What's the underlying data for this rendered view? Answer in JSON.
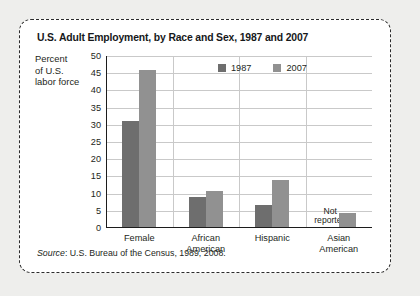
{
  "figure": {
    "title": "U.S. Adult Employment, by Race and Sex, 1987 and 2007",
    "axis_title_lines": [
      "Percent",
      "of U.S.",
      "labor force"
    ],
    "source_label": "Source",
    "source_text": ": U.S. Bureau of the Census, 1989, 2008.",
    "annotation": {
      "line1": "Not",
      "line2": "reported"
    }
  },
  "colors": {
    "series_1987": "#6e6e6e",
    "series_2007": "#919191",
    "grid": "#c9c9c9",
    "axis": "#1c1c1c",
    "panel_background": "#ffffff",
    "page_background": "#eeeeec",
    "text": "#1d1f21"
  },
  "chart_data": {
    "type": "bar",
    "title": "U.S. Adult Employment, by Race and Sex, 1987 and 2007",
    "xlabel": "",
    "ylabel": "Percent of U.S. labor force",
    "ylim": [
      0,
      50
    ],
    "ytick_step": 5,
    "yticks": [
      "50",
      "45",
      "40",
      "35",
      "30",
      "25",
      "20",
      "15",
      "10",
      "5",
      "0"
    ],
    "grid": true,
    "legend_position": "inside top-center",
    "categories": [
      "Female",
      "African American",
      "Hispanic",
      "Asian American"
    ],
    "category_lines": [
      [
        "Female"
      ],
      [
        "African",
        "American"
      ],
      [
        "Hispanic"
      ],
      [
        "Asian",
        "American"
      ]
    ],
    "series": [
      {
        "name": "1987",
        "values": [
          31,
          9,
          6.7,
          null
        ]
      },
      {
        "name": "2007",
        "values": [
          46,
          10.7,
          14,
          4.5
        ]
      }
    ],
    "annotations": [
      {
        "category": "Asian American",
        "series": "1987",
        "text": "Not reported"
      }
    ]
  }
}
